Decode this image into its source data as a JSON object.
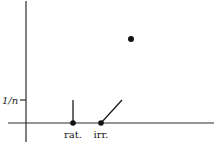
{
  "figure": {
    "y_tick_label": "1/n",
    "points": [
      {
        "name": "rational-point",
        "label": "rat.",
        "segment": "vertical",
        "height": "1/n"
      },
      {
        "name": "irrational-point",
        "label": "irr.",
        "segment": "diagonal",
        "height": "1/n"
      },
      {
        "name": "isolated-point",
        "label": ""
      }
    ]
  }
}
